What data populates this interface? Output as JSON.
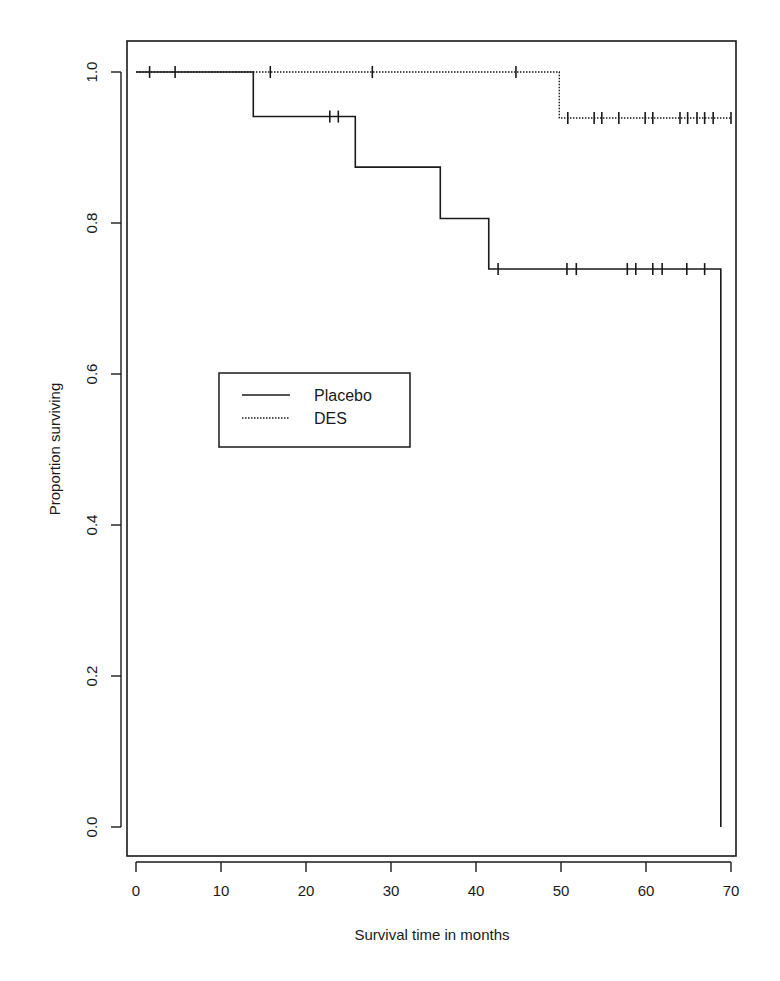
{
  "chart_data": {
    "type": "line",
    "subtype": "kaplan-meier step",
    "title": "",
    "xlabel": "Survival time in months",
    "ylabel": "Proportion surviving",
    "xlim": [
      0,
      70
    ],
    "ylim": [
      0.0,
      1.0
    ],
    "xticks": [
      0,
      10,
      20,
      30,
      40,
      50,
      60,
      70
    ],
    "xtick_labels": [
      "0",
      "10",
      "20",
      "30",
      "40",
      "50",
      "60",
      "70"
    ],
    "yticks": [
      0.0,
      0.2,
      0.4,
      0.6,
      0.8,
      1.0
    ],
    "ytick_labels": [
      "0.0",
      "0.2",
      "0.4",
      "0.6",
      "0.8",
      "1.0"
    ],
    "grid": false,
    "legend": {
      "position": "inside, middle-left",
      "entries": [
        {
          "label": "Placebo",
          "style": "solid"
        },
        {
          "label": "DES",
          "style": "dotted"
        }
      ]
    },
    "series": [
      {
        "name": "Placebo",
        "style": "solid",
        "color": "#1a1a1a",
        "steps": [
          {
            "x": 0,
            "y": 1.0
          },
          {
            "x": 13.8,
            "y": 0.941
          },
          {
            "x": 25.8,
            "y": 0.874
          },
          {
            "x": 35.8,
            "y": 0.806
          },
          {
            "x": 41.5,
            "y": 0.739
          },
          {
            "x": 68.8,
            "y": 0.0
          }
        ],
        "end_x": 68.8,
        "censored": [
          {
            "x": 1.6,
            "y": 1.0
          },
          {
            "x": 4.6,
            "y": 1.0
          },
          {
            "x": 22.8,
            "y": 0.941
          },
          {
            "x": 23.8,
            "y": 0.941
          },
          {
            "x": 42.6,
            "y": 0.739
          },
          {
            "x": 50.7,
            "y": 0.739
          },
          {
            "x": 51.8,
            "y": 0.739
          },
          {
            "x": 57.8,
            "y": 0.739
          },
          {
            "x": 58.8,
            "y": 0.739
          },
          {
            "x": 60.8,
            "y": 0.739
          },
          {
            "x": 61.9,
            "y": 0.739
          },
          {
            "x": 64.8,
            "y": 0.739
          },
          {
            "x": 66.9,
            "y": 0.739
          }
        ]
      },
      {
        "name": "DES",
        "style": "dotted",
        "color": "#1a1a1a",
        "steps": [
          {
            "x": 0,
            "y": 1.0
          },
          {
            "x": 49.8,
            "y": 0.939
          }
        ],
        "end_x": 70.0,
        "censored": [
          {
            "x": 15.8,
            "y": 1.0
          },
          {
            "x": 27.8,
            "y": 1.0
          },
          {
            "x": 44.7,
            "y": 1.0
          },
          {
            "x": 50.8,
            "y": 0.939
          },
          {
            "x": 53.9,
            "y": 0.939
          },
          {
            "x": 54.8,
            "y": 0.939
          },
          {
            "x": 56.8,
            "y": 0.939
          },
          {
            "x": 59.9,
            "y": 0.939
          },
          {
            "x": 60.8,
            "y": 0.939
          },
          {
            "x": 64.0,
            "y": 0.939
          },
          {
            "x": 64.9,
            "y": 0.939
          },
          {
            "x": 66.0,
            "y": 0.939
          },
          {
            "x": 66.9,
            "y": 0.939
          },
          {
            "x": 67.9,
            "y": 0.939
          },
          {
            "x": 70.0,
            "y": 0.939
          }
        ]
      }
    ]
  },
  "layout": {
    "plot_box": {
      "left": 127,
      "top": 41,
      "right": 736,
      "bottom": 856
    },
    "x_map": {
      "px0": 136,
      "px_per_unit": 8.5
    },
    "y_map": {
      "py0": 827,
      "py_per_unit": 755
    },
    "legend_box": {
      "left": 219,
      "top": 373,
      "right": 410,
      "bottom": 447
    },
    "ink": "#1a1a1a"
  }
}
